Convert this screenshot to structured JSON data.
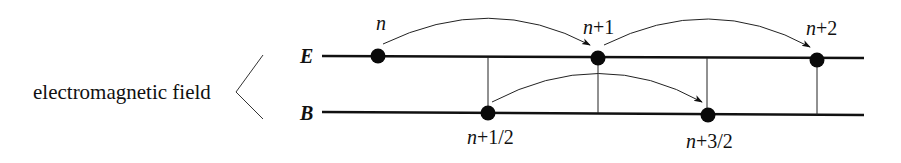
{
  "diagram": {
    "group_label": "electromagnetic field",
    "fields": [
      {
        "id": "E",
        "label": "E"
      },
      {
        "id": "B",
        "label": "B"
      }
    ],
    "e_nodes": [
      {
        "label": "n",
        "var": "n",
        "suffix": ""
      },
      {
        "label": "n+1",
        "var": "n",
        "suffix": "+1"
      },
      {
        "label": "n+2",
        "var": "n",
        "suffix": "+2"
      }
    ],
    "b_nodes": [
      {
        "label": "n+1/2",
        "var": "n",
        "suffix": "+1/2"
      },
      {
        "label": "n+3/2",
        "var": "n",
        "suffix": "+3/2"
      }
    ],
    "arrows": [
      {
        "from": "n",
        "to": "n+1",
        "field": "E"
      },
      {
        "from": "n+1",
        "to": "n+2",
        "field": "E"
      },
      {
        "from": "n+1/2",
        "to": "n+3/2",
        "field": "B"
      }
    ],
    "colors": {
      "line": "#111111",
      "node": "#0a0a0a",
      "background": "#ffffff"
    }
  }
}
